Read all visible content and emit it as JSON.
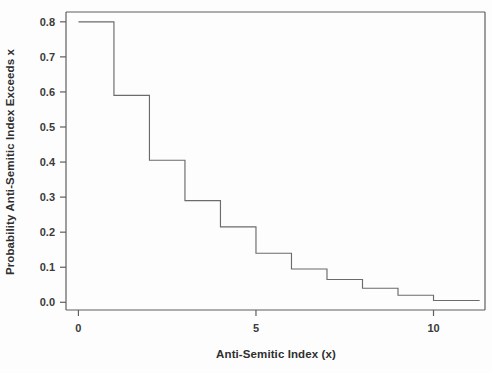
{
  "chart_data": {
    "type": "line",
    "title": "",
    "xlabel": "Anti-Semitic Index (x)",
    "ylabel": "Probability Anti-Semitic Index Exceeds x",
    "xlim": [
      -0.35,
      11.45
    ],
    "ylim": [
      -0.022,
      0.828
    ],
    "grid": false,
    "legend": null,
    "x_ticks": [
      0,
      5,
      10
    ],
    "x_tick_labels": [
      "0",
      "5",
      "10"
    ],
    "y_ticks": [
      0.0,
      0.1,
      0.2,
      0.3,
      0.4,
      0.5,
      0.6,
      0.7,
      0.8
    ],
    "y_tick_labels": [
      "0.0",
      "0.1",
      "0.2",
      "0.3",
      "0.4",
      "0.5",
      "0.6",
      "0.7",
      "0.8"
    ],
    "series": [
      {
        "name": "Survival function",
        "style": "step-post",
        "color": "#6b6b6b",
        "x": [
          0,
          1,
          2,
          3,
          4,
          5,
          6,
          7,
          8,
          9,
          10,
          11.3
        ],
        "values": [
          0.8,
          0.59,
          0.405,
          0.29,
          0.215,
          0.14,
          0.095,
          0.065,
          0.04,
          0.02,
          0.005,
          0.005
        ]
      }
    ],
    "steps": [
      {
        "x_start": 0,
        "x_end": 1,
        "y": 0.8
      },
      {
        "x_start": 1,
        "x_end": 2,
        "y": 0.59
      },
      {
        "x_start": 2,
        "x_end": 3,
        "y": 0.405
      },
      {
        "x_start": 3,
        "x_end": 4,
        "y": 0.29
      },
      {
        "x_start": 4,
        "x_end": 5,
        "y": 0.215
      },
      {
        "x_start": 5,
        "x_end": 6,
        "y": 0.14
      },
      {
        "x_start": 6,
        "x_end": 7,
        "y": 0.095
      },
      {
        "x_start": 7,
        "x_end": 8,
        "y": 0.065
      },
      {
        "x_start": 8,
        "x_end": 9,
        "y": 0.04
      },
      {
        "x_start": 9,
        "x_end": 10,
        "y": 0.02
      },
      {
        "x_start": 10,
        "x_end": 11.3,
        "y": 0.005
      }
    ]
  }
}
